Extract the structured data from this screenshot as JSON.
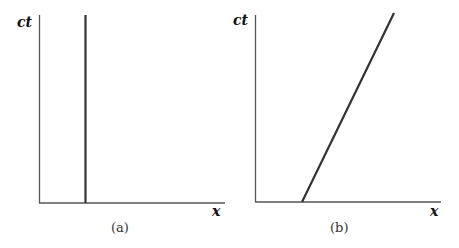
{
  "panels": [
    {
      "id": "a",
      "caption": "(a)",
      "y_axis_label": "ct",
      "x_axis_label": "x",
      "worldline": "vertical line (stationary object)"
    },
    {
      "id": "b",
      "caption": "(b)",
      "y_axis_label": "ct",
      "x_axis_label": "x",
      "worldline": "slanted line (object moving at constant velocity)"
    }
  ],
  "colors": {
    "axis": "#444444",
    "line": "#333333"
  }
}
